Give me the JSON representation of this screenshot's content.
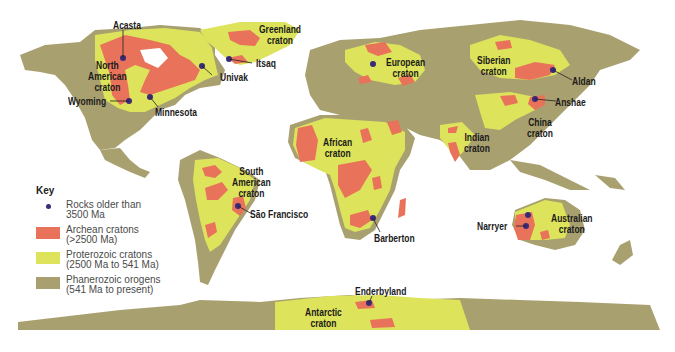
{
  "colors": {
    "archean": "#e8735a",
    "proterozoic": "#dde35a",
    "phanerozoic": "#a9a070",
    "old_rock_dot": "#3b2a78",
    "ocean": "#ffffff"
  },
  "cratons": [
    {
      "name": "North American craton",
      "line1": "North",
      "line2": "American",
      "line3": "craton"
    },
    {
      "name": "Greenland craton",
      "line1": "Greenland",
      "line2": "craton"
    },
    {
      "name": "European craton",
      "line1": "European",
      "line2": "craton"
    },
    {
      "name": "Siberian craton",
      "line1": "Siberian",
      "line2": "craton"
    },
    {
      "name": "China craton",
      "line1": "China",
      "line2": "craton"
    },
    {
      "name": "Indian craton",
      "line1": "Indian",
      "line2": "craton"
    },
    {
      "name": "African craton",
      "line1": "African",
      "line2": "craton"
    },
    {
      "name": "South American craton",
      "line1": "South",
      "line2": "American",
      "line3": "craton"
    },
    {
      "name": "Australian craton",
      "line1": "Australian",
      "line2": "craton"
    },
    {
      "name": "Antarctic craton",
      "line1": "Antarctic",
      "line2": "craton"
    }
  ],
  "sites": [
    {
      "name": "Acasta"
    },
    {
      "name": "Wyoming"
    },
    {
      "name": "Minnesota"
    },
    {
      "name": "Univak"
    },
    {
      "name": "Itsaq"
    },
    {
      "name": "Aldan"
    },
    {
      "name": "Anshae"
    },
    {
      "name": "São Francisco"
    },
    {
      "name": "Barberton"
    },
    {
      "name": "Narryer"
    },
    {
      "name": "Enderbyland"
    }
  ],
  "key": {
    "title": "Key",
    "items": [
      {
        "line1": "Rocks older than",
        "line2": "3500 Ma"
      },
      {
        "line1": "Archean cratons",
        "line2": "(>2500 Ma)"
      },
      {
        "line1": "Proterozoic cratons",
        "line2": "(2500 Ma to 541 Ma)"
      },
      {
        "line1": "Phanerozoic orogens",
        "line2": "(541 Ma to present)"
      }
    ]
  }
}
